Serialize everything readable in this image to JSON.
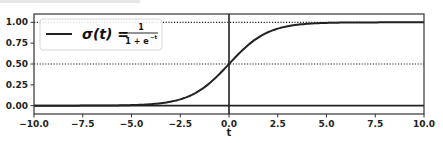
{
  "chart_data": {
    "type": "line",
    "title": "",
    "xlabel": "t",
    "ylabel": "",
    "xlim": [
      -10.0,
      10.0
    ],
    "ylim": [
      -0.1,
      1.1
    ],
    "grid": false,
    "legend_position": "upper left",
    "xticks": [
      "-10.0",
      "-7.5",
      "-5.0",
      "-2.5",
      "0.0",
      "2.5",
      "5.0",
      "7.5",
      "10.0"
    ],
    "xtick_values": [
      -10,
      -7.5,
      -5,
      -2.5,
      0,
      2.5,
      5,
      7.5,
      10
    ],
    "yticks": [
      "0.00",
      "0.25",
      "0.50",
      "0.75",
      "1.00"
    ],
    "ytick_values": [
      0,
      0.25,
      0.5,
      0.75,
      1.0
    ],
    "series": [
      {
        "name": "σ(t) = 1 / (1 + e^-t)",
        "style": "solid",
        "color": "#222222",
        "x": [
          -10,
          -8,
          -6,
          -5,
          -4,
          -3,
          -2,
          -1,
          0,
          1,
          2,
          3,
          4,
          5,
          6,
          8,
          10
        ],
        "y": [
          5e-05,
          0.0003,
          0.0025,
          0.0067,
          0.018,
          0.047,
          0.119,
          0.269,
          0.5,
          0.731,
          0.881,
          0.953,
          0.982,
          0.993,
          0.9975,
          0.9997,
          0.99995
        ]
      }
    ],
    "reference_lines": [
      {
        "orientation": "horizontal",
        "y": 0.0,
        "style": "solid",
        "span": [
          -10,
          10
        ]
      },
      {
        "orientation": "horizontal",
        "y": 0.5,
        "style": "dotted",
        "span": [
          -10,
          10
        ]
      },
      {
        "orientation": "horizontal",
        "y": 1.0,
        "style": "dotted",
        "span": [
          -10,
          10
        ]
      },
      {
        "orientation": "vertical",
        "x": 0.0,
        "style": "solid",
        "span": [
          -0.1,
          1.1
        ]
      }
    ],
    "legend": {
      "entries": [
        {
          "label_main": "σ(t) = ",
          "numerator": "1",
          "denominator": "1 + e",
          "exponent": "−t"
        }
      ]
    }
  }
}
